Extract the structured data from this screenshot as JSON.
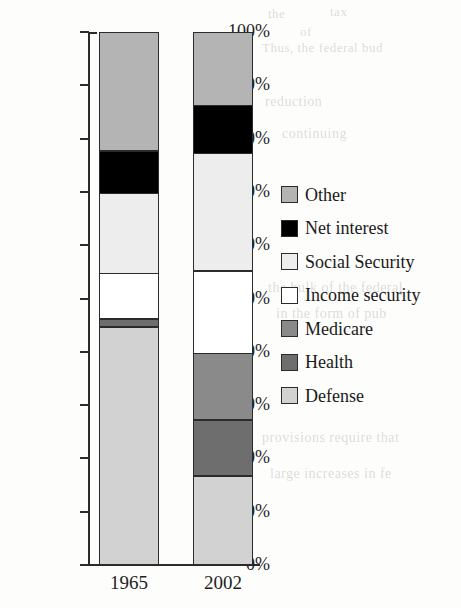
{
  "chart_data": {
    "type": "bar",
    "title": "",
    "subtitle": "",
    "xlabel": "",
    "ylabel": "",
    "stacked": true,
    "stack_mode": "percent",
    "grid": false,
    "legend_position": "right",
    "categories": [
      "1965",
      "2002"
    ],
    "ylim": [
      0,
      100
    ],
    "ytick_labels": [
      "0%",
      "10%",
      "20%",
      "30%",
      "40%",
      "50%",
      "60%",
      "70%",
      "80%",
      "90%",
      "100%"
    ],
    "ytick_values": [
      0,
      10,
      20,
      30,
      40,
      50,
      60,
      70,
      80,
      90,
      100
    ],
    "series": [
      {
        "name": "Defense",
        "color": "#d2d2d2",
        "values": [
          45.0,
          17.0
        ]
      },
      {
        "name": "Health",
        "color": "#6e6e6e",
        "values": [
          1.5,
          10.5
        ]
      },
      {
        "name": "Medicare",
        "color": "#8a8a8a",
        "values": [
          0.0,
          12.5
        ]
      },
      {
        "name": "Income security",
        "color": "#ffffff",
        "values": [
          8.5,
          15.5
        ]
      },
      {
        "name": "Social Security",
        "color": "#ededed",
        "values": [
          15.0,
          22.0
        ]
      },
      {
        "name": "Net interest",
        "color": "#000000",
        "values": [
          8.0,
          9.0
        ]
      },
      {
        "name": "Other",
        "color": "#b4b4b4",
        "values": [
          22.0,
          13.5
        ]
      }
    ]
  },
  "legend": {
    "items": [
      {
        "label": "Other",
        "color": "#b4b4b4"
      },
      {
        "label": "Net interest",
        "color": "#000000"
      },
      {
        "label": "Social Security",
        "color": "#ededed"
      },
      {
        "label": "Income security",
        "color": "#ffffff"
      },
      {
        "label": "Medicare",
        "color": "#8a8a8a"
      },
      {
        "label": "Health",
        "color": "#6e6e6e"
      },
      {
        "label": "Defense",
        "color": "#d2d2d2"
      }
    ]
  },
  "axis": {
    "y_ticks": [
      "100%",
      "90%",
      "80%",
      "70%",
      "60%",
      "50%",
      "40%",
      "30%",
      "20%",
      "10%",
      "0%"
    ],
    "x_ticks": [
      "1965",
      "2002"
    ]
  },
  "background_text": {
    "lines": [
      "the",
      "tax",
      "of",
      "Thus, the federal bud",
      "reduction",
      "continuing",
      "the bulk of the federal",
      "in the form of pub",
      "provisions require that",
      "large increases in fe"
    ]
  }
}
